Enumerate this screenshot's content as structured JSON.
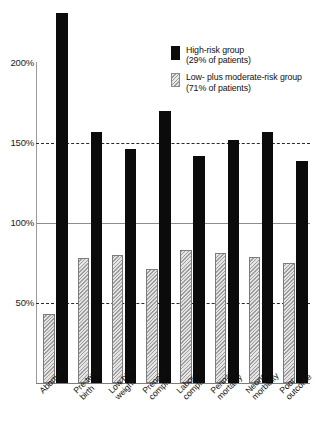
{
  "chart_data": {
    "type": "bar",
    "title": "",
    "subtitle": "",
    "xlabel": "",
    "ylabel": "",
    "ylim": [
      0,
      240
    ],
    "yticks": [
      50,
      100,
      150,
      200
    ],
    "ytick_labels": [
      "50%",
      "100%",
      "150%",
      "200%"
    ],
    "gridlines": [
      {
        "value": 50,
        "style": "dashed"
      },
      {
        "value": 100,
        "style": "solid"
      },
      {
        "value": 150,
        "style": "dashed"
      },
      {
        "value": 200,
        "style": "none"
      }
    ],
    "grid": true,
    "legend_position": "top-right",
    "categories": [
      "Abortion",
      "Pre-term\nbirth",
      "Low birth\nweight",
      "Prenatal\ncompl.",
      "Labor\ncompl.",
      "Perinatal\nmortality",
      "Neonatal\nmorbidity",
      "Poor\noutcome"
    ],
    "series": [
      {
        "name": "Low- plus moderate-risk group",
        "key": "low",
        "pattern": "hatched",
        "color": "#9e9e9e",
        "values": [
          43,
          78,
          80,
          71,
          83,
          81,
          79,
          75
        ]
      },
      {
        "name": "High-risk group",
        "key": "high",
        "pattern": "solid",
        "color": "#0b0b0b",
        "values": [
          231,
          157,
          146,
          170,
          142,
          152,
          157,
          139
        ]
      }
    ],
    "annotations": []
  },
  "legend": {
    "entries": [
      {
        "swatch": "high",
        "line1": "High-risk group",
        "line2": "(29% of patients)"
      },
      {
        "swatch": "low",
        "line1": "Low- plus moderate-risk group",
        "line2": "(71% of patients)"
      }
    ]
  }
}
